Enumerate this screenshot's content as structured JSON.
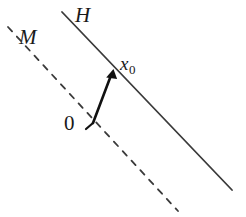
{
  "figure": {
    "width": 246,
    "height": 217,
    "background_color": "#ffffff",
    "stroke_color": "#3a3a3a",
    "arrow_color": "#111111",
    "text_color": "#1a1a1a"
  },
  "labels": {
    "hyperplane": "H",
    "subspace": "M",
    "point": "x",
    "point_subscript": "0",
    "origin": "0"
  },
  "geometry": {
    "solid_line": {
      "name": "hyperplane-line-H",
      "style": "solid",
      "x1": 62,
      "y1": 12,
      "x2": 232,
      "y2": 190,
      "stroke_width": 1.8
    },
    "dashed_line": {
      "name": "subspace-line-M",
      "style": "dashed",
      "x1": 8,
      "y1": 27,
      "x2": 178,
      "y2": 211,
      "stroke_width": 1.8,
      "dash_pattern": "6 7"
    },
    "vector_arrow": {
      "name": "vector-x0",
      "x1": 93,
      "y1": 123,
      "x2": 113,
      "y2": 70,
      "stroke_width": 2.6,
      "head_length": 11,
      "head_width": 8
    },
    "origin_tick": {
      "name": "origin-tick-mark",
      "x1": 93,
      "y1": 123,
      "x2": 86,
      "y2": 129,
      "stroke_width": 2.2
    }
  }
}
